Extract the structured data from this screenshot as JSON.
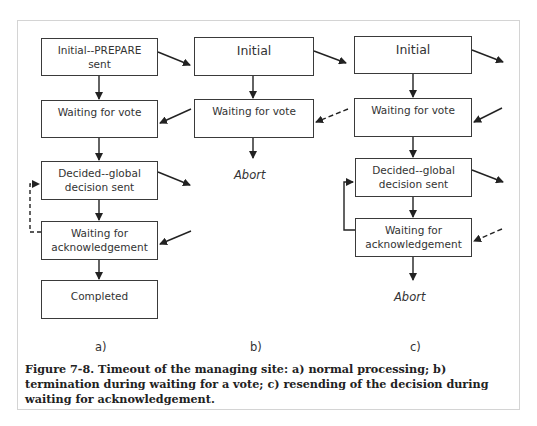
{
  "figure": {
    "caption": "Figure 7-8. Timeout of the managing site: a) normal processing; b) termination during waiting for a vote; c) resending of the decision during waiting for acknowledgement.",
    "panels": [
      {
        "id": "a",
        "label": "a)",
        "states": [
          {
            "line1": "Initial--PREPARE",
            "line2": "sent"
          },
          {
            "line1": "Waiting for vote",
            "line2": ""
          },
          {
            "line1": "Decided--global",
            "line2": "decision sent"
          },
          {
            "line1": "Waiting for",
            "line2": "acknowledgement"
          },
          {
            "line1": "Completed",
            "line2": ""
          }
        ],
        "end_label": ""
      },
      {
        "id": "b",
        "label": "b)",
        "states": [
          {
            "line1": "Initial",
            "line2": ""
          },
          {
            "line1": "Waiting for vote",
            "line2": ""
          }
        ],
        "end_label": "Abort"
      },
      {
        "id": "c",
        "label": "c)",
        "states": [
          {
            "line1": "Initial",
            "line2": ""
          },
          {
            "line1": "Waiting for vote",
            "line2": ""
          },
          {
            "line1": "Decided--global",
            "line2": "decision sent"
          },
          {
            "line1": "Waiting for",
            "line2": "acknowledgement"
          }
        ],
        "end_label": "Abort"
      }
    ]
  },
  "colors": {
    "stroke": "#222222",
    "box_border": "#3a3a3a",
    "frame_border": "#d4d4d4",
    "background": "#ffffff"
  }
}
